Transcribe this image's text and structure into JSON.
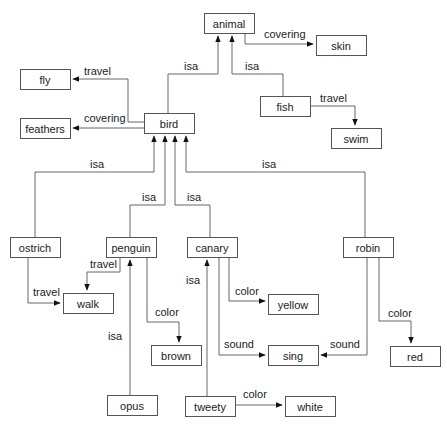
{
  "diagram": {
    "type": "semantic-network",
    "nodes": [
      {
        "id": "animal",
        "label": "animal",
        "x": 204,
        "y": 13,
        "w": 50,
        "h": 20
      },
      {
        "id": "skin",
        "label": "skin",
        "x": 316,
        "y": 35,
        "w": 50,
        "h": 20
      },
      {
        "id": "fly",
        "label": "fly",
        "x": 20,
        "y": 69,
        "w": 50,
        "h": 20
      },
      {
        "id": "feathers",
        "label": "feathers",
        "x": 20,
        "y": 118,
        "w": 50,
        "h": 20
      },
      {
        "id": "bird",
        "label": "bird",
        "x": 144,
        "y": 113,
        "w": 50,
        "h": 20
      },
      {
        "id": "fish",
        "label": "fish",
        "x": 260,
        "y": 96,
        "w": 50,
        "h": 20
      },
      {
        "id": "swim",
        "label": "swim",
        "x": 331,
        "y": 128,
        "w": 50,
        "h": 20
      },
      {
        "id": "ostrich",
        "label": "ostrich",
        "x": 10,
        "y": 237,
        "w": 50,
        "h": 20
      },
      {
        "id": "penguin",
        "label": "penguin",
        "x": 106,
        "y": 237,
        "w": 50,
        "h": 20
      },
      {
        "id": "canary",
        "label": "canary",
        "x": 187,
        "y": 237,
        "w": 50,
        "h": 20
      },
      {
        "id": "robin",
        "label": "robin",
        "x": 343,
        "y": 237,
        "w": 50,
        "h": 20
      },
      {
        "id": "walk",
        "label": "walk",
        "x": 63,
        "y": 293,
        "w": 50,
        "h": 20
      },
      {
        "id": "yellow",
        "label": "yellow",
        "x": 268,
        "y": 294,
        "w": 50,
        "h": 20
      },
      {
        "id": "brown",
        "label": "brown",
        "x": 151,
        "y": 345,
        "w": 50,
        "h": 20
      },
      {
        "id": "sing",
        "label": "sing",
        "x": 268,
        "y": 345,
        "w": 50,
        "h": 20
      },
      {
        "id": "red",
        "label": "red",
        "x": 390,
        "y": 346,
        "w": 50,
        "h": 20
      },
      {
        "id": "opus",
        "label": "opus",
        "x": 107,
        "y": 395,
        "w": 50,
        "h": 20
      },
      {
        "id": "tweety",
        "label": "tweety",
        "x": 185,
        "y": 396,
        "w": 50,
        "h": 20
      },
      {
        "id": "white",
        "label": "white",
        "x": 285,
        "y": 396,
        "w": 50,
        "h": 20
      }
    ],
    "edges": [
      {
        "from": "bird",
        "to": "animal",
        "label": "isa",
        "path": "M168,113 L168,74 L218,74 L218,36",
        "lx": 184,
        "ly": 70
      },
      {
        "from": "animal",
        "to": "skin",
        "label": "covering",
        "path": "M245,33 L245,44 L313,44",
        "lx": 264,
        "ly": 38
      },
      {
        "from": "fish",
        "to": "animal",
        "label": "isa",
        "path": "M283,96 L283,74 L232,74 L232,36",
        "lx": 245,
        "ly": 70
      },
      {
        "from": "fish",
        "to": "swim",
        "label": "travel",
        "path": "M310,106 L355,106 L355,125",
        "lx": 320,
        "ly": 102
      },
      {
        "from": "bird",
        "to": "fly",
        "label": "travel",
        "path": "M144,122 L128,122 L128,79 L73,79",
        "lx": 84,
        "ly": 75
      },
      {
        "from": "bird",
        "to": "feathers",
        "label": "covering",
        "path": "M144,128 L73,128",
        "lx": 84,
        "ly": 122
      },
      {
        "from": "ostrich",
        "to": "bird",
        "label": "isa",
        "path": "M35,237 L35,172 L154,172 L154,136",
        "lx": 90,
        "ly": 168
      },
      {
        "from": "penguin",
        "to": "bird",
        "label": "isa",
        "path": "M130,237 L130,205 L165,205 L165,136",
        "lx": 142,
        "ly": 201
      },
      {
        "from": "canary",
        "to": "bird",
        "label": "isa",
        "path": "M210,237 L210,205 L175,205 L175,136",
        "lx": 187,
        "ly": 201
      },
      {
        "from": "robin",
        "to": "bird",
        "label": "isa",
        "path": "M365,237 L365,172 L186,172 L186,136",
        "lx": 262,
        "ly": 168
      },
      {
        "from": "ostrich",
        "to": "walk",
        "label": "travel",
        "path": "M28,257 L28,303 L60,303",
        "lx": 33,
        "ly": 296
      },
      {
        "from": "penguin",
        "to": "walk",
        "label": "travel",
        "path": "M120,257 L120,272 L87,272 L87,290",
        "lx": 90,
        "ly": 268
      },
      {
        "from": "opus",
        "to": "penguin",
        "label": "isa",
        "path": "M130,395 L130,260",
        "lx": 108,
        "ly": 340
      },
      {
        "from": "penguin",
        "to": "brown",
        "label": "color",
        "path": "M147,257 L147,322 L179,322 L179,342",
        "lx": 155,
        "ly": 316
      },
      {
        "from": "canary",
        "to": "yellow",
        "label": "color",
        "path": "M229,257 L229,301 L265,301",
        "lx": 235,
        "ly": 295
      },
      {
        "from": "canary",
        "to": "sing",
        "label": "sound",
        "path": "M219,257 L219,355 L265,355",
        "lx": 224,
        "ly": 348
      },
      {
        "from": "tweety",
        "to": "canary",
        "label": "isa",
        "path": "M207,396 L207,260",
        "lx": 186,
        "ly": 284
      },
      {
        "from": "tweety",
        "to": "white",
        "label": "color",
        "path": "M235,405 L282,405",
        "lx": 243,
        "ly": 398
      },
      {
        "from": "robin",
        "to": "sing",
        "label": "sound",
        "path": "M367,257 L367,355 L321,355",
        "lx": 330,
        "ly": 348
      },
      {
        "from": "robin",
        "to": "red",
        "label": "color",
        "path": "M379,257 L379,321 L411,321 L411,343",
        "lx": 388,
        "ly": 317
      }
    ]
  }
}
